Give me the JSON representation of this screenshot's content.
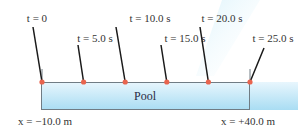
{
  "diagram": {
    "pool": {
      "label": "Pool",
      "left_label": "x = −10.0 m",
      "right_label": "x = +40.0 m",
      "x_start_m": -10.0,
      "x_end_m": 40.0,
      "fill_top": "#e8f6fd",
      "fill_bottom": "#a9ddf3",
      "edge_color": "#707c84"
    },
    "markers": [
      {
        "label": "t = 0",
        "t_s": 0
      },
      {
        "label": "t = 5.0 s",
        "t_s": 5.0
      },
      {
        "label": "t = 10.0 s",
        "t_s": 10.0
      },
      {
        "label": "t = 15.0 s",
        "t_s": 15.0
      },
      {
        "label": "t = 20.0 s",
        "t_s": 20.0
      },
      {
        "label": "t = 25.0 s",
        "t_s": 25.0
      }
    ],
    "dot_color": "#e8644e",
    "line_color": "#1a1a1a",
    "beam_color": "#cdeefa"
  }
}
